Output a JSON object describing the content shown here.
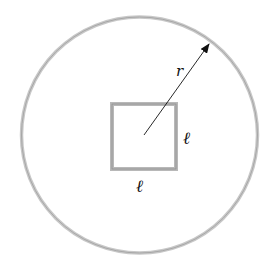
{
  "diagram": {
    "circle": {
      "cx": 139.5,
      "cy": 135,
      "r": 118,
      "stroke": "#bdbdbd"
    },
    "square": {
      "x": 112,
      "y": 104,
      "size": 65,
      "stroke": "#b5b5b5"
    },
    "radius_arrow": {
      "x1": 144,
      "y1": 135,
      "x2": 209,
      "y2": 44,
      "color": "#111111"
    },
    "labels": {
      "radius": "r",
      "side_right": "ℓ",
      "side_bottom": "ℓ"
    }
  }
}
